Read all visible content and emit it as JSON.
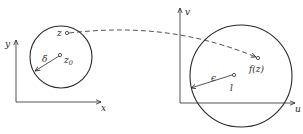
{
  "diagram": {
    "left_panel": {
      "axes": {
        "horizontal_label": "x",
        "vertical_label": "y"
      },
      "circle": {
        "radius_label": "δ"
      },
      "points": {
        "center": {
          "label": "z",
          "subscript": "0"
        },
        "moving": {
          "label": "z"
        }
      }
    },
    "right_panel": {
      "axes": {
        "horizontal_label": "u",
        "vertical_label": "v"
      },
      "circle": {
        "radius_label": "ϵ"
      },
      "points": {
        "center": {
          "label": "l"
        },
        "image": {
          "label": "f(z)"
        }
      }
    },
    "mapping": {
      "style": "dashed-arrow",
      "from": "z",
      "to": "f(z)"
    },
    "colors": {
      "ink": "#2a2a2a",
      "background": "#ffffff"
    }
  }
}
